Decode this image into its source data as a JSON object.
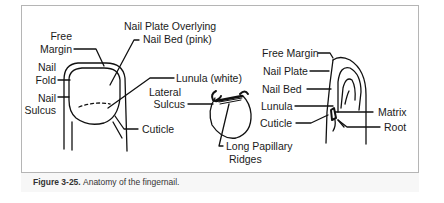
{
  "figure": {
    "number_label": "Figure 3-25.",
    "caption": "Anatomy of the fingernail."
  },
  "labels": {
    "left": {
      "nail_plate_overlying_1": "Nail Plate Overlying",
      "nail_plate_overlying_2": "Nail Bed (pink)",
      "free_margin_1": "Free",
      "free_margin_2": "Margin",
      "nail_fold_1": "Nail",
      "nail_fold_2": "Fold",
      "nail_sulcus_1": "Nail",
      "nail_sulcus_2": "Sulcus",
      "lunula": "Lunula (white)",
      "cuticle": "Cuticle"
    },
    "middle": {
      "lateral_sulcus_1": "Lateral",
      "lateral_sulcus_2": "Sulcus",
      "long_papillary_1": "Long Papillary",
      "long_papillary_2": "Ridges"
    },
    "right": {
      "free_margin": "Free Margin",
      "nail_plate": "Nail Plate",
      "nail_bed": "Nail Bed",
      "lunula": "Lunula",
      "cuticle": "Cuticle",
      "matrix": "Matrix",
      "root": "Root"
    }
  }
}
